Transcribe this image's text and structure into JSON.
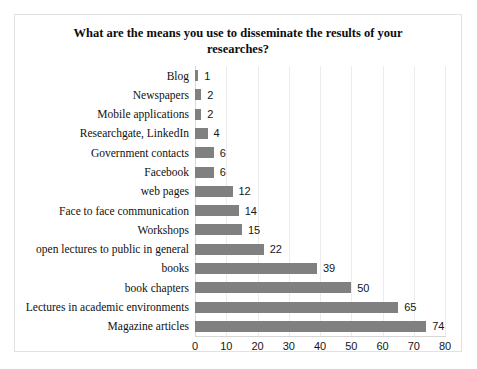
{
  "chart_data": {
    "type": "bar",
    "orientation": "horizontal",
    "title": "What are the means you use to disseminate the results of your researches?",
    "xlabel": "",
    "ylabel": "",
    "xlim": [
      0,
      80
    ],
    "xticks": [
      0,
      10,
      20,
      30,
      40,
      50,
      60,
      70,
      80
    ],
    "grid": "vertical",
    "legend": "none",
    "bar_color": "#808080",
    "categories": [
      "Blog",
      "Newspapers",
      "Mobile applications",
      "Researchgate, LinkedIn",
      "Government contacts",
      "Facebook",
      "web pages",
      "Face to face communication",
      "Workshops",
      "open lectures to public in general",
      "books",
      "book chapters",
      "Lectures in academic environments",
      "Magazine articles"
    ],
    "values": [
      1,
      2,
      2,
      4,
      6,
      6,
      12,
      14,
      15,
      22,
      39,
      50,
      65,
      74
    ],
    "data_labels": [
      "1",
      "2",
      "2",
      "4",
      "6",
      "6",
      "12",
      "14",
      "15",
      "22",
      "39",
      "50",
      "65",
      "74"
    ]
  }
}
